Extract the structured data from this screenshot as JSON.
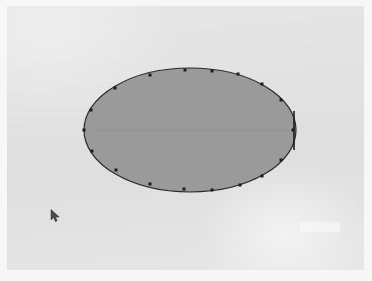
{
  "app": {
    "window_title": "",
    "view": "drawing-canvas"
  },
  "canvas": {
    "background_color": "#e6e7e6",
    "paper_color": "#f7f7f7",
    "width": 372,
    "height": 281,
    "origin_x": 7,
    "origin_y": 6,
    "inner_width": 357,
    "inner_height": 264
  },
  "shape": {
    "type": "ellipse",
    "label": "Ellipse",
    "state": "selected",
    "center_x": 190,
    "center_y": 130,
    "radius_x": 106,
    "radius_y": 62,
    "fill_color": "#9a9a9a",
    "stroke_color": "#2b2b2b",
    "stroke_width": 1.2
  },
  "selection": {
    "handle_color": "#1c1c1c",
    "handle_size": 3,
    "handle_count": 16,
    "handles": [
      {
        "name": "node-left",
        "x": 84,
        "y": 130
      },
      {
        "name": "node-upper-left-outer",
        "x": 91,
        "y": 110
      },
      {
        "name": "node-upper-left",
        "x": 115,
        "y": 88
      },
      {
        "name": "node-top-left",
        "x": 150,
        "y": 75
      },
      {
        "name": "node-top",
        "x": 185,
        "y": 70
      },
      {
        "name": "node-top-mid",
        "x": 212,
        "y": 71
      },
      {
        "name": "node-top-right",
        "x": 238,
        "y": 74
      },
      {
        "name": "node-upper-right",
        "x": 262,
        "y": 84
      },
      {
        "name": "node-right-upper",
        "x": 281,
        "y": 100
      },
      {
        "name": "node-right",
        "x": 293,
        "y": 130
      },
      {
        "name": "node-right-lower",
        "x": 281,
        "y": 160
      },
      {
        "name": "node-lower-right",
        "x": 262,
        "y": 176
      },
      {
        "name": "node-bottom-right",
        "x": 240,
        "y": 185
      },
      {
        "name": "node-bottom",
        "x": 212,
        "y": 190
      },
      {
        "name": "node-bottom-mid",
        "x": 184,
        "y": 189
      },
      {
        "name": "node-bottom-left",
        "x": 150,
        "y": 184
      },
      {
        "name": "node-lower-left",
        "x": 116,
        "y": 170
      },
      {
        "name": "node-lower-left-outer",
        "x": 92,
        "y": 151
      }
    ],
    "right_bar": {
      "name": "right-resize-bar",
      "x": 294,
      "y_top": 111,
      "y_bottom": 150,
      "color": "#1c1c1c"
    },
    "midline": {
      "name": "horizontal-midline",
      "x1": 96,
      "x2": 290,
      "y": 130,
      "color": "#8d8d8d"
    }
  },
  "cursor": {
    "name": "mouse-pointer",
    "icon": "arrow-cursor",
    "x": 50,
    "y": 209,
    "color": "#4a4a4a"
  },
  "artifacts": [
    {
      "name": "scan-highlight",
      "x": 300,
      "y": 222,
      "width": 40,
      "height": 10
    }
  ],
  "colors": {
    "shape_fill": "#9a9a9a",
    "shape_stroke": "#2b2b2b",
    "canvas": "#e6e7e6",
    "handle": "#1c1c1c"
  }
}
